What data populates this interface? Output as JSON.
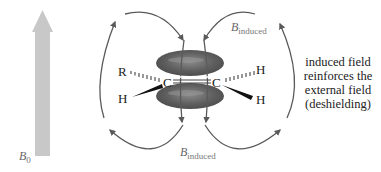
{
  "diagram": {
    "external_field": {
      "symbol": "B",
      "subscript": "0",
      "arrow_color": "#c8c8c8"
    },
    "induced_field_top": {
      "symbol": "B",
      "subscript": "induced"
    },
    "induced_field_bottom": {
      "symbol": "B",
      "subscript": "induced"
    },
    "molecule": {
      "left_carbon": "C",
      "right_carbon": "C",
      "left_substituent_dashed": "R",
      "left_substituent_wedge": "H",
      "right_substituent_dashed": "H",
      "right_substituent_wedge": "H",
      "pi_cloud_color": "#5c5c5c"
    },
    "field_line_color": "#5a5a5a",
    "annotation": {
      "lines": [
        "induced field",
        "reinforces the",
        "external field",
        "(deshielding)"
      ]
    }
  }
}
